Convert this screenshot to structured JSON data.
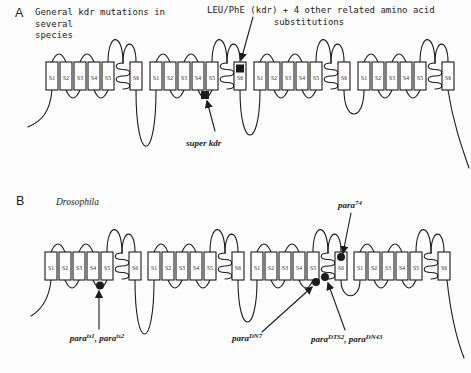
{
  "colors": {
    "ink": "#1b1b1b",
    "paper": "#fdfdfd"
  },
  "figure": {
    "panel_a": {
      "panel_letter": "A",
      "title_lines": [
        "General kdr mutations in",
        "several",
        "species"
      ],
      "kdr_annotation_lines": [
        "LEU/PhE (kdr) + 4 other related amino acid",
        "substitutions"
      ],
      "super_kdr_label": "super kdr",
      "segment_labels": [
        "S1",
        "S2",
        "S3",
        "S4",
        "S5",
        "S6"
      ]
    },
    "panel_b": {
      "panel_letter": "B",
      "species_label": "Drosophila",
      "segment_labels": [
        "S1",
        "S2",
        "S3",
        "S4",
        "S5",
        "S6"
      ],
      "mutation_labels": {
        "ts": [
          {
            "t": "para"
          },
          {
            "t": "ts1",
            "sup": true
          },
          {
            "t": ", "
          },
          {
            "t": "para"
          },
          {
            "t": "ts2",
            "sup": true
          }
        ],
        "dn7": [
          {
            "t": "para"
          },
          {
            "t": "DN7",
            "sup": true
          }
        ],
        "dts2_dn43": [
          {
            "t": "para"
          },
          {
            "t": "DTS2",
            "sup": true
          },
          {
            "t": ", "
          },
          {
            "t": "para"
          },
          {
            "t": "DN43",
            "sup": true
          }
        ],
        "para74": [
          {
            "t": "para"
          },
          {
            "t": "74",
            "sup": true
          }
        ]
      }
    }
  }
}
